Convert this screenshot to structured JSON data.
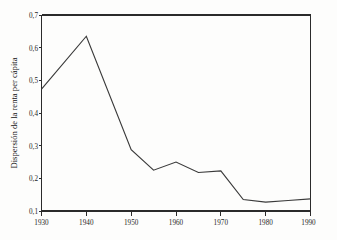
{
  "chart_data": {
    "type": "line",
    "title": "",
    "subtitle": "",
    "xlabel": "",
    "ylabel": "Dispersión de la renta per cápita",
    "xlim": [
      1930,
      1990
    ],
    "ylim": [
      0.1,
      0.7
    ],
    "grid": false,
    "legend": false,
    "legend_position": "none",
    "line_color": "#3a3a3a",
    "axis_color": "#2b2b2b",
    "x_tick_labels": [
      "1930",
      "1940",
      "1950",
      "1960",
      "1970",
      "1980",
      "1990"
    ],
    "x_ticks": [
      1930,
      1940,
      1950,
      1960,
      1970,
      1980,
      1990
    ],
    "y_tick_labels": [
      "0,1",
      "0,2",
      "0,3",
      "0,4",
      "0,5",
      "0,6",
      "0,7"
    ],
    "y_ticks": [
      0.1,
      0.2,
      0.3,
      0.4,
      0.5,
      0.6,
      0.7
    ],
    "series": [
      {
        "name": "Dispersión de la renta per cápita",
        "x": [
          1930,
          1940,
          1950,
          1955,
          1960,
          1965,
          1970,
          1975,
          1980,
          1985,
          1990
        ],
        "values": [
          0.473,
          0.635,
          0.288,
          0.225,
          0.25,
          0.218,
          0.223,
          0.135,
          0.127,
          0.132,
          0.137
        ]
      }
    ]
  }
}
